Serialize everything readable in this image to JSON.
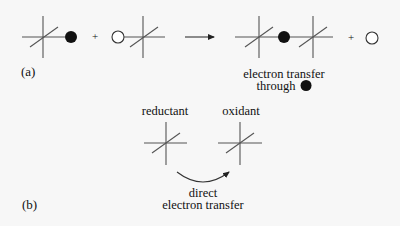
{
  "figure": {
    "panel_a": {
      "label": "(a)",
      "plus_1": "+",
      "plus_2": "+",
      "caption_line1": "electron transfer",
      "caption_line2": "through",
      "caption_symbol": "filled-circle"
    },
    "panel_b": {
      "label": "(b)",
      "reductant_label": "reductant",
      "oxidant_label": "oxidant",
      "caption_line1": "direct",
      "caption_line2": "electron transfer"
    },
    "colors": {
      "stroke": "#333333",
      "filled_circle": "#111111",
      "background": "#f7f7f7"
    }
  }
}
